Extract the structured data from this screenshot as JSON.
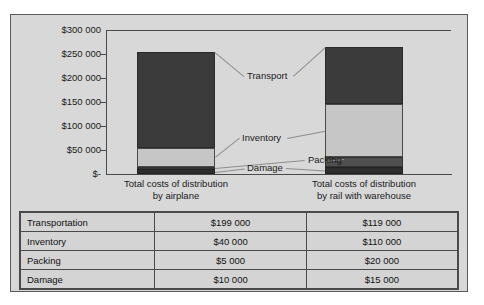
{
  "chart_data": {
    "type": "bar",
    "subtype": "stacked-column",
    "title": "",
    "xlabel": "",
    "ylabel": "",
    "ylim": [
      0,
      300000
    ],
    "ytick_labels": [
      "$300 000",
      "$250 000",
      "$200 000",
      "$150 000",
      "$100 000",
      "$50 000",
      "$-"
    ],
    "ytick_values": [
      300000,
      250000,
      200000,
      150000,
      100000,
      50000,
      0
    ],
    "grid": false,
    "legend": "callouts-inline",
    "categories": [
      "Total costs of distribution by airplane",
      "Total costs of distribution by rail with warehouse"
    ],
    "category_lines": [
      [
        "Total costs of distribution",
        "by airplane"
      ],
      [
        "Total costs of distribution",
        "by rail with warehouse"
      ]
    ],
    "series": [
      {
        "name": "Transportation",
        "values": [
          199000,
          119000
        ],
        "color": "#3b3b3b"
      },
      {
        "name": "Inventory",
        "values": [
          40000,
          110000
        ],
        "color": "#c6c6c6"
      },
      {
        "name": "Packing",
        "values": [
          5000,
          20000
        ],
        "color": "#4f4f4f"
      },
      {
        "name": "Damage",
        "values": [
          10000,
          15000
        ],
        "color": "#2e2e2e"
      }
    ],
    "totals": [
      254000,
      264000
    ],
    "callouts": [
      {
        "label": "Transport"
      },
      {
        "label": "Inventory"
      },
      {
        "label": "Packing"
      },
      {
        "label": "Damage"
      }
    ]
  },
  "table": {
    "columns": [
      "",
      "Airplane",
      "Rail with warehouse"
    ],
    "rows": [
      {
        "name": "Transportation",
        "airplane": "$199 000",
        "rail": "$119 000"
      },
      {
        "name": "Inventory",
        "airplane": "$40 000",
        "rail": "$110 000"
      },
      {
        "name": "Packing",
        "airplane": "$5 000",
        "rail": "$20 000"
      },
      {
        "name": "Damage",
        "airplane": "$10 000",
        "rail": "$15 000"
      }
    ]
  },
  "colors": {
    "panel": "#d8d8d8",
    "table_cell": "#d4d4d4",
    "border": "#4a4a4a",
    "transport": "#3b3b3b",
    "inventory": "#c6c6c6",
    "packing": "#4f4f4f",
    "damage": "#2e2e2e"
  }
}
